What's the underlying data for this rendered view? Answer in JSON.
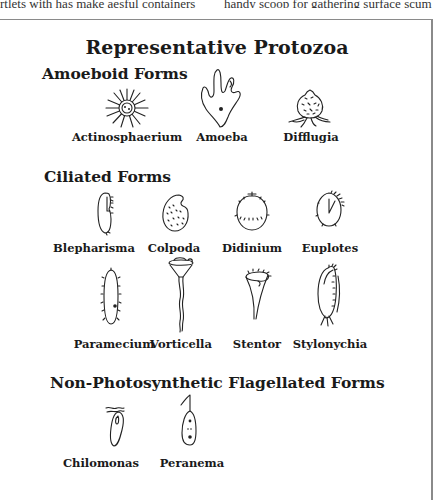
{
  "page_header_fragments": {
    "left": "rtlets with has make aesful containers",
    "right": "handy scoop for gathering surface scum"
  },
  "figure": {
    "title": "Representative Protozoa",
    "sections": [
      {
        "heading": "Amoeboid Forms",
        "organisms": [
          {
            "name": "Actinosphaerium",
            "icon": "actinosphaerium-drawing-icon"
          },
          {
            "name": "Amoeba",
            "icon": "amoeba-drawing-icon"
          },
          {
            "name": "Difflugia",
            "icon": "difflugia-drawing-icon"
          }
        ]
      },
      {
        "heading": "Ciliated Forms",
        "organisms": [
          {
            "name": "Blepharisma",
            "icon": "blepharisma-drawing-icon"
          },
          {
            "name": "Colpoda",
            "icon": "colpoda-drawing-icon"
          },
          {
            "name": "Didinium",
            "icon": "didinium-drawing-icon"
          },
          {
            "name": "Euplotes",
            "icon": "euplotes-drawing-icon"
          },
          {
            "name": "Paramecium",
            "icon": "paramecium-drawing-icon"
          },
          {
            "name": "Vorticella",
            "icon": "vorticella-drawing-icon"
          },
          {
            "name": "Stentor",
            "icon": "stentor-drawing-icon"
          },
          {
            "name": "Stylonychia",
            "icon": "stylonychia-drawing-icon"
          }
        ]
      },
      {
        "heading": "Non-Photosynthetic Flagellated Forms",
        "organisms": [
          {
            "name": "Chilomonas",
            "icon": "chilomonas-drawing-icon"
          },
          {
            "name": "Peranema",
            "icon": "peranema-drawing-icon"
          }
        ]
      }
    ]
  }
}
